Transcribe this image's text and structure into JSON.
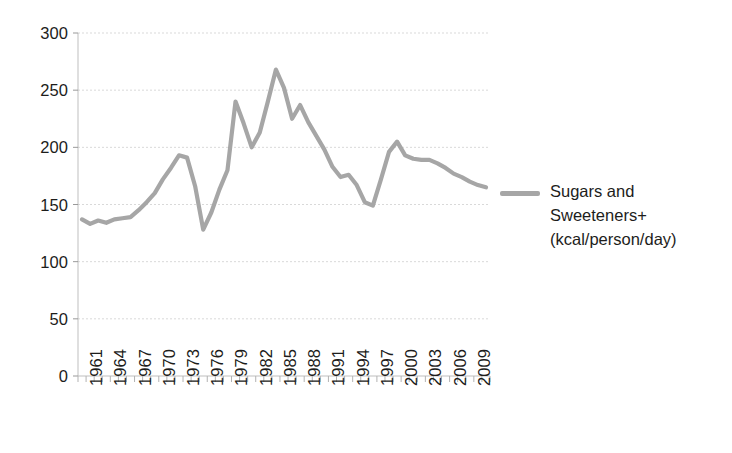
{
  "chart_data": {
    "type": "line",
    "title": "",
    "xlabel": "",
    "ylabel": "",
    "ylim": [
      0,
      300
    ],
    "ytick_step": 50,
    "ytick_labels": [
      "300",
      "250",
      "200",
      "150",
      "100",
      "50",
      "0"
    ],
    "ytick_values": [
      300,
      250,
      200,
      150,
      100,
      50,
      0
    ],
    "xtick_labels": [
      "1961",
      "1964",
      "1967",
      "1970",
      "1973",
      "1976",
      "1979",
      "1982",
      "1985",
      "1988",
      "1991",
      "1994",
      "1997",
      "2000",
      "2003",
      "2006",
      "2009"
    ],
    "xtick_values": [
      1961,
      1964,
      1967,
      1970,
      1973,
      1976,
      1979,
      1982,
      1985,
      1988,
      1991,
      1994,
      1997,
      2000,
      2003,
      2006,
      2009
    ],
    "grid": true,
    "grid_axis": "y",
    "legend_position": "right",
    "x": [
      1961,
      1962,
      1963,
      1964,
      1965,
      1966,
      1967,
      1968,
      1969,
      1970,
      1971,
      1972,
      1973,
      1974,
      1975,
      1976,
      1977,
      1978,
      1979,
      1980,
      1981,
      1982,
      1983,
      1984,
      1985,
      1986,
      1987,
      1988,
      1989,
      1990,
      1991,
      1992,
      1993,
      1994,
      1995,
      1996,
      1997,
      1998,
      1999,
      2000,
      2001,
      2002,
      2003,
      2004,
      2005,
      2006,
      2007,
      2008,
      2009,
      2010,
      2011
    ],
    "series": [
      {
        "name": "Sugars and Sweeteners+ (kcal/person/day)",
        "color": "#a6a6a6",
        "values": [
          137,
          133,
          136,
          134,
          137,
          138,
          139,
          145,
          152,
          160,
          172,
          182,
          193,
          191,
          166,
          128,
          143,
          163,
          180,
          240,
          221,
          200,
          213,
          240,
          268,
          252,
          225,
          237,
          222,
          210,
          198,
          183,
          174,
          176,
          167,
          152,
          149,
          172,
          196,
          205,
          193,
          190,
          189,
          189,
          186,
          182,
          177,
          174,
          170,
          167,
          165
        ]
      }
    ]
  },
  "legend": {
    "entries": [
      {
        "color": "#a6a6a6",
        "line1": "Sugars and",
        "line2": "Sweeteners+",
        "line3": "(kcal/person/day)"
      }
    ]
  }
}
